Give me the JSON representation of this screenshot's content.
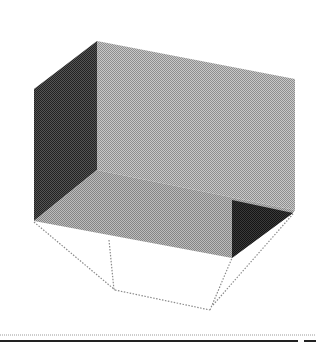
{
  "figure": {
    "colors": {
      "background": "#ffffff",
      "back_wall": "#b4b4b4",
      "floor": "#a9a9a9",
      "left_wall": "#3c3c3c",
      "right_notch": "#2a2a2a",
      "wireframe": "#8a8a8a",
      "divider_dotted": "#9a9a9a",
      "bottom_bar": "#222222"
    },
    "faces": {
      "back_wall": "97,41 295,79 295,210 97,170",
      "left_wall": "34,89 97,41 97,170 34,221",
      "floor": "34,221 97,170 295,210 293,213 232,258",
      "right_notch": "232,200 293,213 232,258"
    },
    "wireframe_lines": [
      {
        "x1": 34,
        "y1": 222,
        "x2": 115,
        "y2": 290
      },
      {
        "x1": 109,
        "y1": 240,
        "x2": 114,
        "y2": 290
      },
      {
        "x1": 115,
        "y1": 290,
        "x2": 210,
        "y2": 310
      },
      {
        "x1": 210,
        "y1": 310,
        "x2": 232,
        "y2": 258
      },
      {
        "x1": 213,
        "y1": 305,
        "x2": 293,
        "y2": 214
      }
    ]
  }
}
